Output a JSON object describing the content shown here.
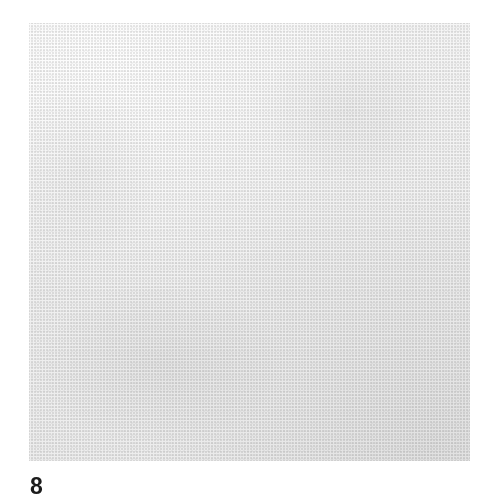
{
  "page": {
    "background_color": "#ffffff",
    "width": 499,
    "height": 504
  },
  "figure": {
    "caption": "8",
    "plate": {
      "background_color": "#f1f1f1",
      "left": 29,
      "top": 23,
      "width": 441,
      "height": 438,
      "medium": "halftone-printed black-and-white photograph",
      "alt_text": "A bare forearm extends from the left edge of the frame toward the right, where the wrist bends sharply downward and the hand is closed into a fist with the thumb extended downward in a thumbs-down gesture."
    },
    "subject": {
      "name": "forearm-and-fist",
      "gesture": "thumbs-down",
      "hand_state": "clenched fist, fingers curled, thumb extended downward",
      "orientation": "forearm horizontal entering from left; hand flexed down at the wrist",
      "skin_tone_highlight": "#f7f5f3",
      "skin_tone_midtone": "#d8d4d0",
      "skin_tone_shadow": "#9a9692",
      "skin_tone_deep_shadow": "#75716d",
      "parts": [
        {
          "name": "forearm",
          "note": "enters at left edge, light on top, dark shaded underside"
        },
        {
          "name": "wrist",
          "note": "narrows and bends downward toward the hand"
        },
        {
          "name": "knuckles",
          "note": "curled index and middle finger knuckles face right"
        },
        {
          "name": "curled-fingers",
          "note": "fingers folded into the palm, creases visible"
        },
        {
          "name": "thumb",
          "note": "extended downward, tip rounded, pointing down-right"
        },
        {
          "name": "heel-of-hand",
          "note": "rounded underside between wrist and thumb"
        }
      ]
    }
  },
  "caption_style": {
    "text_color": "#1b1b1b",
    "font_size_px": 23,
    "weight": "bold"
  }
}
